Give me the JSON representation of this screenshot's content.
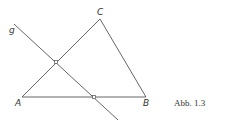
{
  "figure": {
    "caption": "Abb. 1.3",
    "points": {
      "A": {
        "label": "A",
        "x": 22,
        "y": 97
      },
      "B": {
        "label": "B",
        "x": 146,
        "y": 97
      },
      "C": {
        "label": "C",
        "x": 100,
        "y": 19
      }
    },
    "line_g": {
      "label": "g",
      "x1": 14,
      "y1": 24,
      "x2": 118,
      "y2": 120
    },
    "intersections": [
      {
        "x": 56,
        "y": 62
      },
      {
        "x": 94,
        "y": 97
      }
    ],
    "colors": {
      "stroke": "#555555",
      "background": "#ffffff"
    }
  }
}
